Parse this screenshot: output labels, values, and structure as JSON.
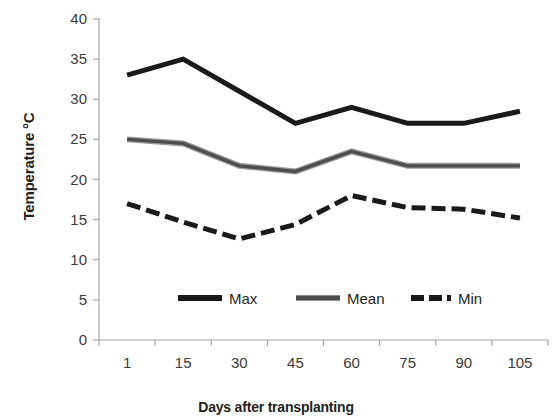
{
  "chart_data": {
    "type": "line",
    "title": "",
    "xlabel": "Days after transplanting",
    "ylabel": "Temperature °C",
    "categories": [
      "1",
      "15",
      "30",
      "45",
      "60",
      "75",
      "90",
      "105"
    ],
    "ylim": [
      0,
      40
    ],
    "yticks": [
      "0",
      "5",
      "10",
      "15",
      "20",
      "25",
      "30",
      "35",
      "40"
    ],
    "grid": false,
    "legend_position": "inside-bottom-center",
    "series": [
      {
        "name": "Max",
        "style": "solid",
        "color": "#1a1a1a",
        "values": [
          33,
          35,
          31,
          27,
          29,
          27,
          27,
          28.5
        ]
      },
      {
        "name": "Mean",
        "style": "solid-double",
        "color": "#4d4d4d",
        "values": [
          25,
          24.5,
          21.7,
          21,
          23.5,
          21.7,
          21.7,
          21.7
        ]
      },
      {
        "name": "Min",
        "style": "dashed",
        "color": "#1a1a1a",
        "values": [
          17,
          14.7,
          12.6,
          14.4,
          18,
          16.5,
          16.3,
          15.2
        ]
      }
    ]
  },
  "axes": {
    "y_title": "Temperature °C",
    "x_title": "Days after transplanting",
    "y_tick_labels": [
      "40",
      "35",
      "30",
      "25",
      "20",
      "15",
      "10",
      "5",
      "0"
    ],
    "x_tick_labels": [
      "1",
      "15",
      "30",
      "45",
      "60",
      "75",
      "90",
      "105"
    ],
    "axis_line_color": "#a6a6a6"
  },
  "legend": {
    "items": [
      {
        "label": "Max"
      },
      {
        "label": "Mean"
      },
      {
        "label": "Min"
      }
    ]
  }
}
